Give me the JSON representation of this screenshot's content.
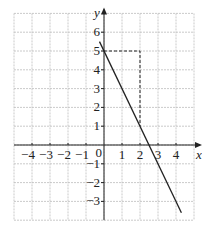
{
  "chart_data": {
    "type": "line",
    "title": "",
    "xlabel": "x",
    "ylabel": "y",
    "xlim": [
      -5,
      5
    ],
    "ylim": [
      -4,
      7
    ],
    "grid": true,
    "x_ticks": [
      "-4",
      "-3",
      "-2",
      "-1",
      "0",
      "1",
      "2",
      "3",
      "4"
    ],
    "y_ticks": [
      "6",
      "5",
      "4",
      "3",
      "2",
      "1",
      "-1",
      "-2",
      "-3"
    ],
    "series": [
      {
        "name": "y = 5 - 2x",
        "style": "solid",
        "x": [
          -0.25,
          4.3
        ],
        "y": [
          5.5,
          -3.6
        ]
      }
    ],
    "annotations": [
      {
        "type": "dashed-guide",
        "points": [
          [
            0,
            5
          ],
          [
            2,
            5
          ],
          [
            2,
            1
          ]
        ]
      }
    ]
  },
  "labels": {
    "x_axis": "x",
    "y_axis": "y",
    "origin": "0"
  }
}
